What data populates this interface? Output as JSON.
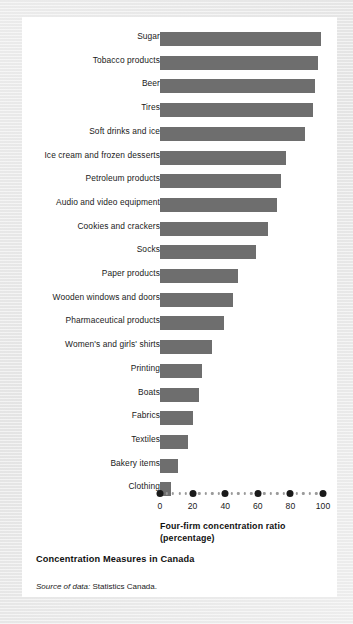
{
  "figure": {
    "title": "Concentration Measures in Canada",
    "source_lead": "Source of data:",
    "source_body": " Statistics Canada.",
    "axis_title_line1": "Four-firm concentration ratio",
    "axis_title_line2": "(percentage)",
    "bar_color": "#6e6e6e",
    "panel_color": "#ffffff",
    "background_color": "#e8e8e8"
  },
  "chart_data": {
    "type": "bar",
    "orientation": "horizontal",
    "title": "Concentration Measures in Canada",
    "xlabel": "Four-firm concentration ratio (percentage)",
    "ylabel": "",
    "xlim": [
      0,
      100
    ],
    "xticks": [
      0,
      20,
      40,
      60,
      80,
      100
    ],
    "xtick_labels": [
      "0",
      "20",
      "40",
      "60",
      "80",
      "100"
    ],
    "grid": false,
    "legend": null,
    "categories": [
      "Sugar",
      "Tobacco products",
      "Beer",
      "Tires",
      "Soft drinks and ice",
      "Ice cream and frozen desserts",
      "Petroleum products",
      "Audio and video equipment",
      "Cookies and crackers",
      "Socks",
      "Paper products",
      "Wooden windows and doors",
      "Pharmaceutical products",
      "Women's and girls' shirts",
      "Printing",
      "Boats",
      "Fabrics",
      "Textiles",
      "Bakery items",
      "Clothing"
    ],
    "values": [
      99,
      97,
      95,
      94,
      89,
      77,
      74,
      72,
      66,
      59,
      48,
      45,
      39,
      32,
      26,
      24,
      20,
      17,
      11,
      7
    ]
  }
}
